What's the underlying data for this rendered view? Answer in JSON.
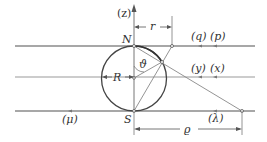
{
  "diagram": {
    "type": "stereographic-projection-geometry",
    "colors": {
      "line": "#8a8a8a",
      "circle": "#444444",
      "text": "#333333"
    },
    "axis_label": "(z)",
    "points": {
      "north": "N",
      "south": "S"
    },
    "dimensions": {
      "r": "r",
      "R": "R",
      "rho": "ϱ"
    },
    "angle": "ϑ",
    "planes": {
      "top": {
        "left": "(q)",
        "right": "(p)"
      },
      "middle": {
        "left": "(y)",
        "right": "(x)"
      },
      "bottom": {
        "left": "(μ)",
        "right": "(λ)"
      }
    }
  }
}
